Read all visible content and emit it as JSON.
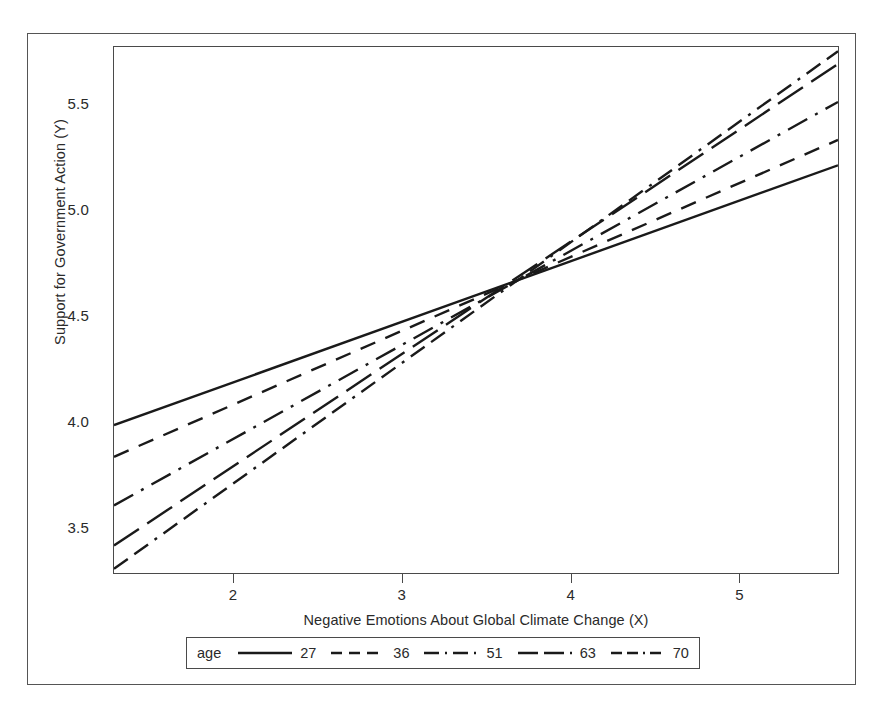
{
  "figure": {
    "background": "#ffffff",
    "line_color": "#1a1a1a",
    "axis_color": "#4a4a4a"
  },
  "chart_data": {
    "type": "line",
    "title": "",
    "subtitle": "",
    "xlabel": "Negative Emotions About Global Climate Change (X)",
    "ylabel": "Support for Government Action (Y)",
    "xlim": [
      1.29,
      5.59
    ],
    "ylim": [
      3.29,
      5.78
    ],
    "xticks": [
      2,
      3,
      4,
      5
    ],
    "xtick_labels": [
      "2",
      "3",
      "4",
      "5"
    ],
    "yticks": [
      3.5,
      4.0,
      4.5,
      5.0,
      5.5
    ],
    "ytick_labels": [
      "3.5",
      "4.0",
      "4.5",
      "5.0",
      "5.5"
    ],
    "grid": false,
    "legend_position": "bottom-outside",
    "legend_title": "age",
    "x": [
      1.29,
      5.59
    ],
    "series": [
      {
        "name": "27",
        "label": "27",
        "dash": "solid",
        "values": [
          3.99,
          5.22
        ],
        "slope": 0.286,
        "intercept": 3.621
      },
      {
        "name": "36",
        "label": "36",
        "dash": "dashed",
        "values": [
          3.84,
          5.34
        ],
        "slope": 0.349,
        "intercept": 3.39
      },
      {
        "name": "51",
        "label": "51",
        "dash": "dash-dot",
        "values": [
          3.61,
          5.52
        ],
        "slope": 0.444,
        "intercept": 3.037
      },
      {
        "name": "63",
        "label": "63",
        "dash": "long-dash",
        "values": [
          3.42,
          5.7
        ],
        "slope": 0.53,
        "intercept": 2.736
      },
      {
        "name": "70",
        "label": "70",
        "dash": "dash-dash-dot",
        "values": [
          3.31,
          5.76
        ],
        "slope": 0.57,
        "intercept": 2.575
      }
    ],
    "convergence_point": {
      "x": 3.8,
      "y": 4.71
    },
    "annotations": []
  }
}
